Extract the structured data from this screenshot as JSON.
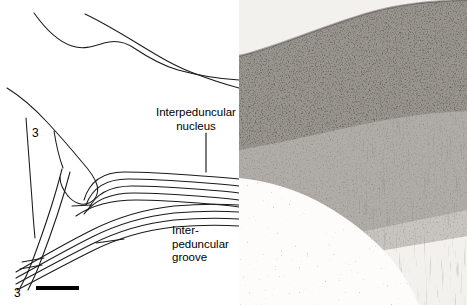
{
  "figure": {
    "width": 467,
    "height": 305,
    "background_color": "#ffffff",
    "line_color": "#1a1a1a"
  },
  "drawing_panel": {
    "name": "schematic-line-drawing",
    "x": 0,
    "y": 0,
    "width": 239,
    "height": 305,
    "description": "Line drawing tracing of brainstem section outlines and decussating fiber bundles"
  },
  "photo_panel": {
    "name": "histology-photomicrograph",
    "x": 239,
    "y": 0,
    "width": 228,
    "height": 305,
    "description": "Nissl-stained photomicrograph of interpeduncular nucleus region"
  },
  "labels": {
    "interpeduncular_nucleus": {
      "line1": "Interpeduncular",
      "line2": "nucleus",
      "x": 150,
      "y": 106,
      "leader_line": {
        "x": 206,
        "y1": 133,
        "y2": 172
      }
    },
    "interpeduncular_groove": {
      "line1": "Inter-",
      "line2": "peduncular",
      "line3": "groove",
      "x": 172,
      "y": 224
    },
    "numeral_upper": {
      "text": "3",
      "x": 32,
      "y": 127
    },
    "numeral_lower": {
      "text": "3",
      "x": 14,
      "y": 287
    }
  },
  "scale_bar": {
    "name": "scale-bar",
    "x": 36,
    "y": 286,
    "width": 43,
    "height": 4,
    "color": "#000000"
  }
}
